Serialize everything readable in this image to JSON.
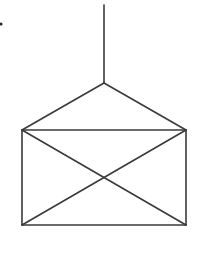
{
  "diagram": {
    "canvas": {
      "width": 198,
      "height": 263,
      "background": "#ffffff"
    },
    "stroke_color": "#3a3a3a",
    "points": {
      "string_top": [
        104,
        5
      ],
      "apex": [
        104,
        83
      ],
      "top_left": [
        22,
        130
      ],
      "top_right": [
        186,
        130
      ],
      "bottom_left": [
        22,
        225
      ],
      "bottom_right": [
        186,
        225
      ],
      "center": [
        104,
        178
      ]
    },
    "segments": [
      {
        "name": "string",
        "from": "string_top",
        "to": "apex"
      },
      {
        "name": "flap-left",
        "from": "apex",
        "to": "top_left"
      },
      {
        "name": "flap-right",
        "from": "apex",
        "to": "top_right"
      },
      {
        "name": "top-edge",
        "from": "top_left",
        "to": "top_right"
      },
      {
        "name": "left-edge",
        "from": "top_left",
        "to": "bottom_left"
      },
      {
        "name": "right-edge",
        "from": "top_right",
        "to": "bottom_right"
      },
      {
        "name": "bottom-edge",
        "from": "bottom_left",
        "to": "bottom_right"
      },
      {
        "name": "diagonal-tl-br",
        "from": "top_left",
        "to": "bottom_right"
      },
      {
        "name": "diagonal-tr-bl",
        "from": "top_right",
        "to": "bottom_left"
      }
    ],
    "marks": [
      {
        "name": "stray-dot",
        "at": [
          1,
          24
        ],
        "radius": 1.6
      }
    ]
  }
}
